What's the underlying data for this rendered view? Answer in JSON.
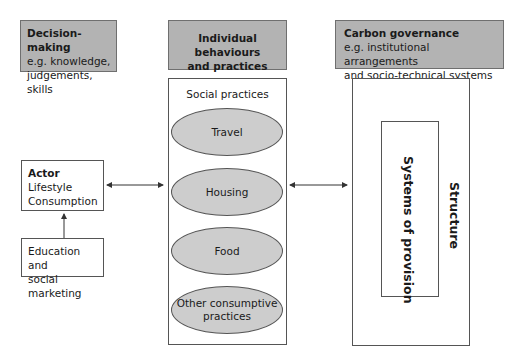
{
  "decision_making": {
    "title": "Decision-making",
    "line1": "e.g. knowledge,",
    "line2": "judgements, skills"
  },
  "individual": {
    "title_line1": "Individual behaviours",
    "title_line2": "and practices"
  },
  "carbon_governance": {
    "title": "Carbon governance",
    "line1": "e.g. institutional arrangements",
    "line2": "and socio-technical systems"
  },
  "actor": {
    "title": "Actor",
    "line1": "Lifestyle",
    "line2": "Consumption"
  },
  "education": {
    "line1": "Education and",
    "line2": "social marketing"
  },
  "social_practices": {
    "label": "Social practices",
    "items": [
      {
        "label": "Travel"
      },
      {
        "label": "Housing"
      },
      {
        "label": "Food"
      },
      {
        "label": "Other consumptive practices",
        "line1": "Other consumptive",
        "line2": "practices"
      }
    ]
  },
  "structure": {
    "label": "Structure",
    "inner_label": "Systems of provision"
  },
  "colors": {
    "header_fill": "#b3b3b3",
    "ellipse_fill": "#cdcdcd",
    "border": "#555555"
  }
}
